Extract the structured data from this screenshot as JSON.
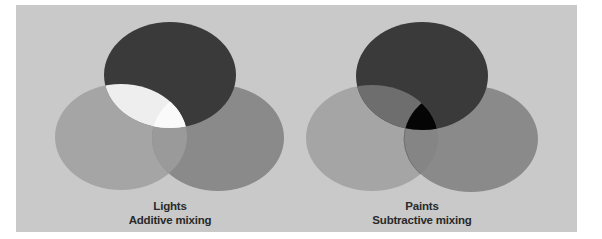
{
  "figure": {
    "background_color": "#c9c9c9",
    "page_color": "#ffffff"
  },
  "diagrams": [
    {
      "id": "additive",
      "title": "Lights",
      "subtitle": "Additive mixing",
      "circles": [
        {
          "name": "top",
          "color": "#3a3a3a",
          "cx": 170,
          "cy": 75,
          "rx": 66,
          "ry": 53
        },
        {
          "name": "left",
          "color": "#a5a5a5",
          "cx": 121,
          "cy": 137,
          "rx": 66,
          "ry": 53
        },
        {
          "name": "right",
          "color": "#8a8a8a",
          "cx": 218,
          "cy": 138,
          "rx": 66,
          "ry": 53
        }
      ],
      "overlaps": {
        "top_left": "#eeeeee",
        "top_right": "#3a3a3a",
        "left_right": "#9a9a9a",
        "all_three": "#fafafa"
      }
    },
    {
      "id": "subtractive",
      "title": "Paints",
      "subtitle": "Subtractive mixing",
      "circles": [
        {
          "name": "top",
          "color": "#3a3a3a",
          "cx": 422,
          "cy": 76,
          "rx": 66,
          "ry": 54
        },
        {
          "name": "left",
          "color": "#a5a5a5",
          "cx": 372,
          "cy": 138,
          "rx": 66,
          "ry": 53
        },
        {
          "name": "right",
          "color": "#8a8a8a",
          "cx": 471,
          "cy": 139,
          "rx": 67,
          "ry": 53
        }
      ],
      "overlaps": {
        "top_left": "#6e6e6e",
        "top_right": "#3a3a3a",
        "left_right": "#858585",
        "all_three": "#050505"
      }
    }
  ]
}
